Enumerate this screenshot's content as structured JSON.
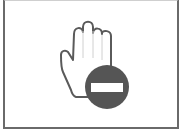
{
  "icon": {
    "name": "stop-hand-no-entry",
    "description": "Raised hand with no-entry sign",
    "colors": {
      "frame": "#6a6a6a",
      "hand_outline": "#5a5a5a",
      "hand_fill": "#ffffff",
      "finger_lines": "#cfcfcf",
      "sign_fill": "#555555",
      "sign_bar": "#ffffff"
    }
  }
}
